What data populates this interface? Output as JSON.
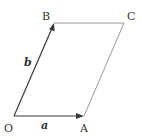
{
  "diagram": {
    "type": "parallelogram-vectors",
    "points": {
      "O": {
        "label": "O",
        "x": 14,
        "y": 116
      },
      "A": {
        "label": "A",
        "x": 84,
        "y": 116
      },
      "B": {
        "label": "B",
        "x": 54,
        "y": 23
      },
      "C": {
        "label": "C",
        "x": 124,
        "y": 23
      }
    },
    "vectors": {
      "a": {
        "label": "a",
        "from": "O",
        "to": "A"
      },
      "b": {
        "label": "b",
        "from": "O",
        "to": "B"
      }
    },
    "edges": [
      {
        "from": "B",
        "to": "C"
      },
      {
        "from": "A",
        "to": "C"
      }
    ],
    "colors": {
      "vector": "#3a3a3a",
      "edge": "#9a9a9a",
      "text": "#333333"
    }
  }
}
